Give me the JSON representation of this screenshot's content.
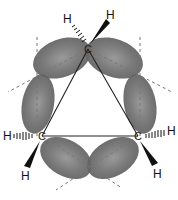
{
  "diagram": {
    "atoms": [
      {
        "id": "C1",
        "label": "C",
        "x": 88,
        "y": 49
      },
      {
        "id": "C2",
        "label": "C",
        "x": 42,
        "y": 136
      },
      {
        "id": "C3",
        "label": "C",
        "x": 138,
        "y": 136
      }
    ],
    "hydrogens": [
      {
        "label": "H",
        "x": 67,
        "y": 21,
        "bond": "hashed",
        "on": "C1"
      },
      {
        "label": "H",
        "x": 111,
        "y": 18,
        "bond": "wedge",
        "on": "C1"
      },
      {
        "label": "H",
        "x": 7,
        "y": 136,
        "bond": "hashed",
        "on": "C2"
      },
      {
        "label": "H",
        "x": 26,
        "y": 176,
        "bond": "wedge",
        "on": "C2"
      },
      {
        "label": "H",
        "x": 174,
        "y": 134,
        "bond": "hashed",
        "on": "C3"
      },
      {
        "label": "H",
        "x": 158,
        "y": 174,
        "bond": "wedge",
        "on": "C3"
      }
    ],
    "colors": {
      "lobe": "#6e6e6e",
      "line": "#222222",
      "dash": "#777777"
    }
  }
}
